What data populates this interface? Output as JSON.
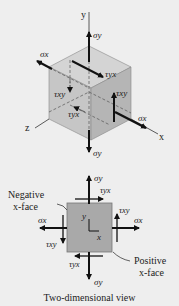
{
  "figure": {
    "caption": "Two-dimensional view",
    "cube": {
      "axes": {
        "x": "x",
        "y": "y",
        "z": "z"
      },
      "labels": {
        "sigma_y_top": "σy",
        "sigma_y_bottom": "σy",
        "sigma_x_left": "σx",
        "sigma_x_right": "σx",
        "tau_yx_top": "τyx",
        "tau_xy_left": "τxy",
        "tau_xy_right": "τxy",
        "tau_yx_front": "τyx"
      }
    },
    "plane": {
      "axes": {
        "x": "x",
        "y": "y"
      },
      "labels": {
        "sigma_y_top": "σy",
        "sigma_y_bottom": "σy",
        "sigma_x_left": "σx",
        "sigma_x_right": "σx",
        "tau_yx_top": "τyx",
        "tau_yx_bottom": "τyx",
        "tau_xy_left": "τxy",
        "tau_xy_right": "τxy"
      },
      "annotations": {
        "negative_face_line1": "Negative",
        "negative_face_line2": "x-face",
        "positive_face_line1": "Positive",
        "positive_face_line2": "x-face"
      }
    },
    "colors": {
      "background": "#eeeeee",
      "cube_top": "#d4d4d4",
      "cube_front": "#c4c4c4",
      "cube_right": "#b5b5b5",
      "square_fill": "#a9a9a9",
      "arrow": "#111111"
    }
  }
}
